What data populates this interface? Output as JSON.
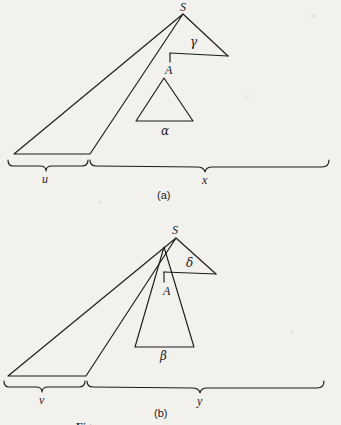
{
  "figure": {
    "caption_partial": "Fig.",
    "background_color": "#f3f1ee",
    "ink_color": "#1b1b1b",
    "panels": [
      {
        "id": "a",
        "panel_label": "(a)",
        "apex_label": "S",
        "inner_apex_label": "A",
        "outer_angle_label": "γ",
        "inner_angle_label": "α",
        "near_distance_label": "u",
        "far_distance_label": "x"
      },
      {
        "id": "b",
        "panel_label": "(b)",
        "apex_label": "S",
        "inner_apex_label": "A",
        "outer_angle_label": "δ",
        "inner_angle_label": "β",
        "near_distance_label": "v",
        "far_distance_label": "y"
      }
    ]
  }
}
